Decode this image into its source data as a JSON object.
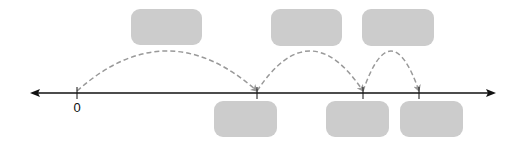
{
  "diagram": {
    "type": "number-line-jumps",
    "colors": {
      "axis": "#111111",
      "arc": "#999999",
      "box_fill": "#cccccc",
      "background": "#ffffff"
    },
    "axis": {
      "y": 93,
      "x_start": 30,
      "x_end": 496,
      "arrows": "both"
    },
    "ticks": [
      {
        "x": 77,
        "label": "0"
      },
      {
        "x": 257,
        "label": ""
      },
      {
        "x": 363,
        "label": ""
      },
      {
        "x": 419,
        "label": ""
      }
    ],
    "jumps": [
      {
        "from_x": 77,
        "to_x": 257,
        "peak_y": 51
      },
      {
        "from_x": 257,
        "to_x": 363,
        "peak_y": 51
      },
      {
        "from_x": 363,
        "to_x": 419,
        "peak_y": 51
      }
    ],
    "top_boxes": [
      {
        "x": 131,
        "y": 9,
        "w": 71,
        "h": 36,
        "text": ""
      },
      {
        "x": 271,
        "y": 9,
        "w": 71,
        "h": 37,
        "text": ""
      },
      {
        "x": 362,
        "y": 9,
        "w": 72,
        "h": 37,
        "text": ""
      }
    ],
    "bottom_boxes": [
      {
        "x": 214,
        "y": 101,
        "w": 63,
        "h": 36,
        "text": ""
      },
      {
        "x": 326,
        "y": 101,
        "w": 63,
        "h": 36,
        "text": ""
      },
      {
        "x": 400,
        "y": 101,
        "w": 63,
        "h": 36,
        "text": ""
      }
    ],
    "labels": {
      "origin": "0"
    }
  }
}
